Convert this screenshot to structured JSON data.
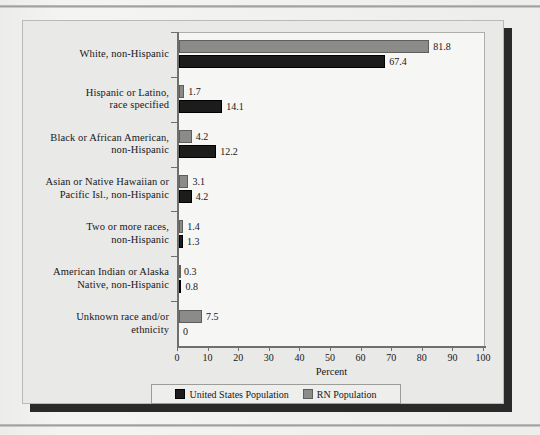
{
  "chart_data": {
    "type": "bar",
    "orientation": "horizontal",
    "title": "",
    "xlabel": "Percent",
    "ylabel": "",
    "xlim": [
      0,
      100
    ],
    "xticks": [
      0,
      10,
      20,
      30,
      40,
      50,
      60,
      70,
      80,
      90,
      100
    ],
    "grid": false,
    "legend_position": "bottom",
    "categories": [
      "White, non-Hispanic",
      "Hispanic or Latino, race specified",
      "Black or African American, non-Hispanic",
      "Asian or Native Hawaiian or Pacific Isl., non-Hispanic",
      "Two or more races, non-Hispanic",
      "American Indian or Alaska Native, non-Hispanic",
      "Unknown race and/or ethnicity"
    ],
    "category_lines": [
      [
        "White, non-Hispanic"
      ],
      [
        "Hispanic or Latino,",
        "race specified"
      ],
      [
        "Black or African American,",
        "non-Hispanic"
      ],
      [
        "Asian or Native Hawaiian or",
        "Pacific Isl., non-Hispanic"
      ],
      [
        "Two or more races,",
        "non-Hispanic"
      ],
      [
        "American Indian or Alaska",
        "Native, non-Hispanic"
      ],
      [
        "Unknown race and/or",
        "ethnicity"
      ]
    ],
    "series": [
      {
        "name": "RN Population",
        "color": "#8b8b89",
        "values": [
          81.8,
          1.7,
          4.2,
          3.1,
          1.4,
          0.3,
          7.5
        ],
        "labels": [
          "81.8",
          "1.7",
          "4.2",
          "3.1",
          "1.4",
          "0.3",
          "7.5"
        ]
      },
      {
        "name": "United States Population",
        "color": "#1c1c1c",
        "values": [
          67.4,
          14.1,
          12.2,
          4.2,
          1.3,
          0.8,
          0
        ],
        "labels": [
          "67.4",
          "14.1",
          "12.2",
          "4.2",
          "1.3",
          "0.8",
          "0"
        ]
      }
    ]
  },
  "legend": {
    "items": [
      {
        "label": "United States Population",
        "swatch": "us"
      },
      {
        "label": "RN Population",
        "swatch": "rn"
      }
    ]
  },
  "axis": {
    "x_title": "Percent"
  }
}
